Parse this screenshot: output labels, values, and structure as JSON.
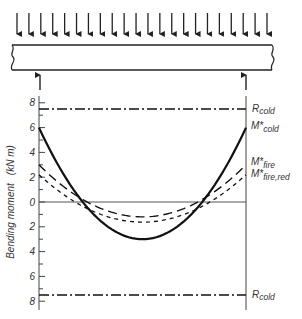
{
  "figure": {
    "beam": {
      "load_arrow_count": 22,
      "support_arrows": 2,
      "description": "Simply supported beam with uniformly distributed load"
    },
    "y_axis": {
      "label": "Bending moment",
      "unit": "(kN m)",
      "ticks_upper": [
        "8",
        "6",
        "4",
        "2",
        "0"
      ],
      "ticks_lower": [
        "2",
        "4",
        "6",
        "8"
      ]
    },
    "labels": {
      "r_cold_top": {
        "base": "R",
        "sub": "cold"
      },
      "m_cold": {
        "base": "M*",
        "sub": "cold"
      },
      "m_fire": {
        "base": "M*",
        "sub": "fire"
      },
      "m_fire_red": {
        "base": "M*",
        "sub": "fire,red"
      },
      "r_cold_bottom": {
        "base": "R",
        "sub": "cold"
      }
    }
  },
  "chart_data": {
    "type": "line",
    "title": "",
    "xlabel": "",
    "ylabel": "Bending moment (kN m)",
    "ylim": [
      -8,
      8
    ],
    "grid": false,
    "x": [
      0,
      0.1,
      0.2,
      0.3,
      0.4,
      0.5,
      0.6,
      0.7,
      0.8,
      0.9,
      1.0
    ],
    "series": [
      {
        "name": "R_cold (hogging)",
        "style": "dash-dot",
        "values": [
          7.5,
          7.5,
          7.5,
          7.5,
          7.5,
          7.5,
          7.5,
          7.5,
          7.5,
          7.5,
          7.5
        ]
      },
      {
        "name": "M*_cold",
        "style": "solid",
        "values": [
          6.0,
          2.76,
          0.24,
          -1.56,
          -2.64,
          -3.0,
          -2.64,
          -1.56,
          0.24,
          2.76,
          6.0
        ]
      },
      {
        "name": "M*_fire",
        "style": "long-dash",
        "values": [
          3.0,
          1.48,
          0.3,
          -0.54,
          -1.05,
          -1.2,
          -1.05,
          -0.54,
          0.3,
          1.48,
          3.0
        ]
      },
      {
        "name": "M*_fire,red",
        "style": "short-dash",
        "values": [
          2.2,
          0.83,
          -0.24,
          -1.01,
          -1.46,
          -1.62,
          -1.46,
          -1.01,
          -0.24,
          0.83,
          2.2
        ]
      },
      {
        "name": "R_cold (sagging)",
        "style": "dash-dot",
        "values": [
          -7.5,
          -7.5,
          -7.5,
          -7.5,
          -7.5,
          -7.5,
          -7.5,
          -7.5,
          -7.5,
          -7.5,
          -7.5
        ]
      }
    ],
    "annotations": [
      "R_cold",
      "M*_cold",
      "M*_fire",
      "M*_fire,red",
      "R_cold"
    ],
    "legend_position": "right (inline labels)"
  }
}
